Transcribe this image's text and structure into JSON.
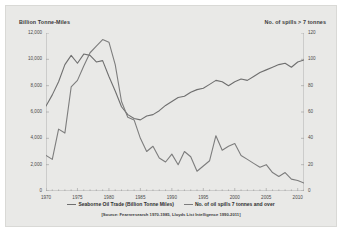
{
  "chart_data": {
    "type": "line",
    "title": "",
    "xlabel": "",
    "ylabel": "Billion Tonne-Miles",
    "y2label": "No. of spills > 7 tonnes",
    "grid": false,
    "legend_position": "bottom",
    "source_note": "[Source: Fearnresearch 1970-1985, Lloyds List Intelligence 1990-2011]",
    "xlim": [
      1970,
      2011
    ],
    "ylim": [
      0,
      12000
    ],
    "y2lim": [
      0,
      120
    ],
    "xticks": [
      "1970",
      "1975",
      "1980",
      "1985",
      "1990",
      "1995",
      "2000",
      "2005",
      "2010"
    ],
    "xtick_values": [
      1970,
      1975,
      1980,
      1985,
      1990,
      1995,
      2000,
      2005,
      2010
    ],
    "yticks": [
      "12,000",
      "10,000",
      "8,000",
      "6,000",
      "4,000",
      "2,000",
      "0"
    ],
    "ytick_values": [
      12000,
      10000,
      8000,
      6000,
      4000,
      2000,
      0
    ],
    "y2ticks": [
      "120",
      "100",
      "80",
      "60",
      "40",
      "20",
      "0"
    ],
    "y2tick_values": [
      120,
      100,
      80,
      60,
      40,
      20,
      0
    ],
    "x": [
      1970,
      1971,
      1972,
      1973,
      1974,
      1975,
      1976,
      1977,
      1978,
      1979,
      1980,
      1981,
      1982,
      1983,
      1984,
      1985,
      1986,
      1987,
      1988,
      1989,
      1990,
      1991,
      1992,
      1993,
      1994,
      1995,
      1996,
      1997,
      1998,
      1999,
      2000,
      2001,
      2002,
      2003,
      2004,
      2005,
      2006,
      2007,
      2008,
      2009,
      2010,
      2011
    ],
    "series": [
      {
        "name": "Seaborne Oil Trade (Billion Tonne Miles)",
        "axis": "left",
        "color": "#6f6f6f",
        "values": [
          6450,
          7300,
          8300,
          9600,
          10300,
          9700,
          10400,
          10300,
          9800,
          9900,
          8700,
          7600,
          6400,
          5800,
          5500,
          5400,
          5700,
          5800,
          6100,
          6500,
          6800,
          7100,
          7200,
          7500,
          7700,
          7800,
          8100,
          8400,
          8300,
          8000,
          8300,
          8500,
          8400,
          8700,
          9000,
          9200,
          9400,
          9600,
          9700,
          9400,
          9800,
          9950
        ]
      },
      {
        "name": "No. of oil spills 7 tonnes and over",
        "axis": "right",
        "color": "#7d7d7d",
        "values": [
          27,
          24,
          47,
          44,
          79,
          84,
          95,
          105,
          110,
          115,
          113,
          96,
          68,
          56,
          54,
          40,
          30,
          34,
          25,
          22,
          28,
          20,
          30,
          26,
          15,
          19,
          23,
          42,
          31,
          34,
          36,
          27,
          24,
          21,
          18,
          20,
          14,
          11,
          14,
          9,
          8,
          6
        ]
      }
    ]
  },
  "legend": {
    "items": [
      {
        "label": "Seaborne Oil Trade (Billion Tonne Miles)"
      },
      {
        "label": "No. of oil spills 7 tonnes and over"
      }
    ]
  },
  "axis_titles": {
    "left": "Billion Tonne-Miles",
    "right": "No. of spills > 7 tonnes"
  }
}
